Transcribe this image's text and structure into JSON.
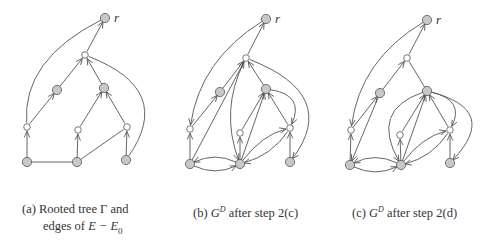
{
  "figure": {
    "colors": {
      "edge": "#555555",
      "gray_node_fill": "#c8c8c8",
      "white_node_fill": "#ffffff",
      "node_stroke": "#555555"
    },
    "panels": [
      {
        "id": "a",
        "caption_line1_prefix": "(a) Rooted tree ",
        "caption_symbol": "Γ",
        "caption_line1_suffix": " and",
        "caption_line2_prefix": "edges of ",
        "caption_line2_math": "E − E",
        "caption_line2_sub": "0",
        "root_label": "r",
        "nodes": {
          "r": {
            "x": 105,
            "y": 18,
            "type": "gray"
          },
          "m": {
            "x": 85,
            "y": 55,
            "type": "white"
          },
          "lg": {
            "x": 57,
            "y": 90,
            "type": "gray"
          },
          "rg": {
            "x": 104,
            "y": 88,
            "type": "gray"
          },
          "lw": {
            "x": 27,
            "y": 127,
            "type": "white"
          },
          "mw": {
            "x": 78,
            "y": 130,
            "type": "white"
          },
          "rw": {
            "x": 127,
            "y": 127,
            "type": "white"
          },
          "bl": {
            "x": 27,
            "y": 162,
            "type": "gray"
          },
          "bm": {
            "x": 77,
            "y": 162,
            "type": "gray"
          },
          "br": {
            "x": 126,
            "y": 160,
            "type": "gray"
          }
        },
        "edges": [
          {
            "from": "m",
            "to": "r",
            "arrow": true
          },
          {
            "from": "lg",
            "to": "m",
            "arrow": true
          },
          {
            "from": "rg",
            "to": "m",
            "arrow": true
          },
          {
            "from": "lw",
            "to": "lg",
            "arrow": true
          },
          {
            "from": "mw",
            "to": "rg",
            "arrow": true
          },
          {
            "from": "rw",
            "to": "rg",
            "arrow": true
          },
          {
            "from": "bl",
            "to": "lw",
            "arrow": true
          },
          {
            "from": "bm",
            "to": "mw",
            "arrow": true
          },
          {
            "from": "br",
            "to": "rw",
            "arrow": true
          },
          {
            "from": "lw",
            "to": "r",
            "arrow": false,
            "curve": [
              22,
              60
            ]
          },
          {
            "from": "bl",
            "to": "bm",
            "arrow": false
          },
          {
            "from": "bm",
            "to": "rw",
            "arrow": false
          },
          {
            "from": "br",
            "to": "m",
            "arrow": false,
            "curve": [
              175,
              90
            ]
          }
        ]
      },
      {
        "id": "b",
        "caption_prefix": "(b) ",
        "caption_G": "G",
        "caption_sup": "D",
        "caption_suffix": " after step 2(c)",
        "root_label": "r",
        "nodes": {
          "r": {
            "x": 266,
            "y": 19,
            "type": "gray"
          },
          "m": {
            "x": 246,
            "y": 58,
            "type": "white"
          },
          "lg": {
            "x": 220,
            "y": 92,
            "type": "gray"
          },
          "rg": {
            "x": 266,
            "y": 89,
            "type": "gray"
          },
          "lw": {
            "x": 190,
            "y": 129,
            "type": "white"
          },
          "mw": {
            "x": 240,
            "y": 133,
            "type": "white"
          },
          "rw": {
            "x": 290,
            "y": 128,
            "type": "white"
          },
          "bl": {
            "x": 190,
            "y": 164,
            "type": "gray"
          },
          "bm": {
            "x": 240,
            "y": 164,
            "type": "gray"
          },
          "br": {
            "x": 290,
            "y": 162,
            "type": "gray"
          }
        },
        "edges": [
          {
            "from": "m",
            "to": "r",
            "arrow": true
          },
          {
            "from": "lw",
            "to": "lg",
            "arrow": true
          },
          {
            "from": "lg",
            "to": "m",
            "arrow": true
          },
          {
            "from": "r",
            "to": "lw",
            "arrow": true,
            "curve": [
              200,
              60
            ]
          },
          {
            "from": "bl",
            "to": "lw",
            "arrow": true
          },
          {
            "from": "bl",
            "to": "m",
            "arrow": true
          },
          {
            "from": "m",
            "to": "bm",
            "arrow": true,
            "curve": [
              220,
              110
            ]
          },
          {
            "from": "rg",
            "to": "m",
            "arrow": true
          },
          {
            "from": "bm",
            "to": "rg",
            "arrow": true
          },
          {
            "from": "mw",
            "to": "rg",
            "arrow": true
          },
          {
            "from": "bm",
            "to": "mw",
            "arrow": true
          },
          {
            "from": "rw",
            "to": "rg",
            "arrow": true
          },
          {
            "from": "rg",
            "to": "rw",
            "arrow": true,
            "curve": [
              305,
              95
            ]
          },
          {
            "from": "bm",
            "to": "rw",
            "arrow": true,
            "curve": [
              262,
              135
            ]
          },
          {
            "from": "rw",
            "to": "bm",
            "arrow": true,
            "curve": [
              272,
              155
            ]
          },
          {
            "from": "br",
            "to": "rw",
            "arrow": true
          },
          {
            "from": "m",
            "to": "br",
            "arrow": true,
            "curve": [
              340,
              95
            ]
          },
          {
            "from": "bm",
            "to": "bl",
            "arrow": true,
            "curve": [
              215,
              152
            ]
          },
          {
            "from": "bl",
            "to": "bm",
            "arrow": true,
            "curve": [
              215,
              176
            ]
          }
        ]
      },
      {
        "id": "c",
        "caption_prefix": "(c) ",
        "caption_G": "G",
        "caption_sup": "D",
        "caption_suffix": " after step 2(d)",
        "root_label": "r",
        "nodes": {
          "r": {
            "x": 427,
            "y": 20,
            "type": "gray"
          },
          "m": {
            "x": 407,
            "y": 58,
            "type": "white"
          },
          "lg": {
            "x": 380,
            "y": 93,
            "type": "gray"
          },
          "rg": {
            "x": 427,
            "y": 91,
            "type": "gray"
          },
          "lw": {
            "x": 351,
            "y": 130,
            "type": "white"
          },
          "mw": {
            "x": 400,
            "y": 135,
            "type": "white"
          },
          "rw": {
            "x": 450,
            "y": 130,
            "type": "white"
          },
          "bl": {
            "x": 350,
            "y": 165,
            "type": "gray"
          },
          "bm": {
            "x": 401,
            "y": 165,
            "type": "gray"
          },
          "br": {
            "x": 450,
            "y": 163,
            "type": "gray"
          }
        },
        "edges": [
          {
            "from": "m",
            "to": "r",
            "arrow": true
          },
          {
            "from": "lg",
            "to": "m",
            "arrow": true
          },
          {
            "from": "lw",
            "to": "lg",
            "arrow": true
          },
          {
            "from": "r",
            "to": "lw",
            "arrow": true,
            "curve": [
              360,
              60
            ]
          },
          {
            "from": "bl",
            "to": "lw",
            "arrow": true
          },
          {
            "from": "lg",
            "to": "bl",
            "arrow": true
          },
          {
            "from": "rg",
            "to": "m",
            "arrow": false
          },
          {
            "from": "bm",
            "to": "rg",
            "arrow": true
          },
          {
            "from": "mw",
            "to": "rg",
            "arrow": true
          },
          {
            "from": "bm",
            "to": "mw",
            "arrow": true
          },
          {
            "from": "rw",
            "to": "rg",
            "arrow": true
          },
          {
            "from": "rg",
            "to": "rw",
            "arrow": true,
            "curve": [
              465,
              100
            ]
          },
          {
            "from": "rg",
            "to": "bm",
            "arrow": true,
            "curve": [
              370,
              110
            ]
          },
          {
            "from": "bm",
            "to": "rw",
            "arrow": true,
            "curve": [
              422,
              137
            ]
          },
          {
            "from": "rw",
            "to": "bm",
            "arrow": true,
            "curve": [
              432,
              157
            ]
          },
          {
            "from": "br",
            "to": "rw",
            "arrow": true
          },
          {
            "from": "rg",
            "to": "br",
            "arrow": true,
            "curve": [
              500,
              110
            ]
          },
          {
            "from": "bm",
            "to": "bl",
            "arrow": true,
            "curve": [
              375,
              152
            ]
          },
          {
            "from": "bl",
            "to": "bm",
            "arrow": true,
            "curve": [
              375,
              177
            ]
          }
        ]
      }
    ]
  }
}
